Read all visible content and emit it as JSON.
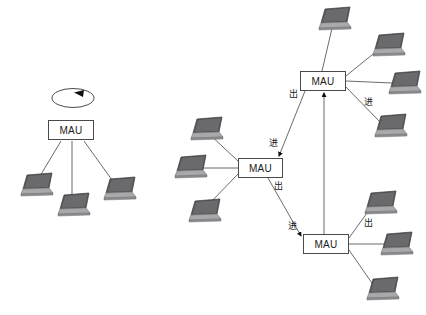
{
  "diagram": {
    "node_label": "MAU",
    "labels": {
      "in": "进",
      "out": "出"
    },
    "colors": {
      "background": "#ffffff",
      "line": "#6b6b6b",
      "node_border": "#4a4a4a",
      "node_text": "#1a1a1a",
      "laptop_screen": "#4a4a4a",
      "laptop_base": "#9a9a9a",
      "arrow": "#111111"
    },
    "clusters": [
      {
        "name": "single-mau-cluster",
        "mau": {
          "id": "mau-left",
          "label": "MAU",
          "x": 48,
          "y": 120,
          "w": 46,
          "h": 20
        },
        "self_loop": {
          "name": "ring-loop",
          "cx": 73,
          "cy": 98,
          "rx": 21,
          "ry": 10,
          "arrow_direction": "left"
        },
        "laptops": [
          {
            "id": "laptop-left-1",
            "x": 18,
            "y": 172
          },
          {
            "id": "laptop-left-2",
            "x": 55,
            "y": 192
          },
          {
            "id": "laptop-left-3",
            "x": 101,
            "y": 176
          }
        ]
      },
      {
        "name": "three-mau-ring-cluster",
        "maus": [
          {
            "id": "mau-top",
            "label": "MAU",
            "x": 300,
            "y": 71,
            "w": 46,
            "h": 20
          },
          {
            "id": "mau-middle",
            "label": "MAU",
            "x": 238,
            "y": 158,
            "w": 45,
            "h": 20
          },
          {
            "id": "mau-bottom",
            "label": "MAU",
            "x": 303,
            "y": 234,
            "w": 46,
            "h": 20
          }
        ],
        "laptops": [
          {
            "id": "laptop-top-1",
            "x": 316,
            "y": 6
          },
          {
            "id": "laptop-top-2",
            "x": 370,
            "y": 32
          },
          {
            "id": "laptop-top-3",
            "x": 386,
            "y": 70
          },
          {
            "id": "laptop-top-4",
            "x": 372,
            "y": 113
          },
          {
            "id": "laptop-mid-1",
            "x": 188,
            "y": 116
          },
          {
            "id": "laptop-mid-2",
            "x": 172,
            "y": 154
          },
          {
            "id": "laptop-mid-3",
            "x": 186,
            "y": 198
          },
          {
            "id": "laptop-bot-1",
            "x": 362,
            "y": 190
          },
          {
            "id": "laptop-bot-2",
            "x": 378,
            "y": 231
          },
          {
            "id": "laptop-bot-3",
            "x": 364,
            "y": 276
          }
        ],
        "ring_links": [
          {
            "id": "link-top-to-middle",
            "from": "mau-top",
            "to": "mau-middle",
            "out_label": "出",
            "in_label": "进"
          },
          {
            "id": "link-middle-to-bottom",
            "from": "mau-middle",
            "to": "mau-bottom",
            "out_label": "出",
            "in_label": "进"
          },
          {
            "id": "link-bottom-to-top",
            "from": "mau-bottom",
            "to": "mau-top",
            "out_label": "出",
            "in_label": "进"
          }
        ]
      }
    ],
    "flow_labels": [
      {
        "id": "label-out-top",
        "text": "出",
        "x": 289,
        "y": 90
      },
      {
        "id": "label-in-middle",
        "text": "进",
        "x": 269,
        "y": 139
      },
      {
        "id": "label-out-middle",
        "text": "出",
        "x": 274,
        "y": 182
      },
      {
        "id": "label-in-bottom",
        "text": "进",
        "x": 288,
        "y": 222
      },
      {
        "id": "label-out-bottom",
        "text": "出",
        "x": 364,
        "y": 219
      },
      {
        "id": "label-in-top",
        "text": "进",
        "x": 364,
        "y": 98
      }
    ]
  }
}
